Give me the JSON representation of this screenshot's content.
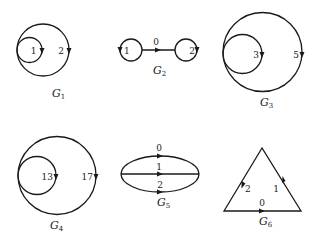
{
  "diagram": {
    "title": "",
    "colors": {
      "ink": "#1a1a1a",
      "background": "#ffffff"
    },
    "graphs": [
      {
        "id": "G1",
        "name": "G",
        "subscript": "1",
        "shape": "two internally tangent loops",
        "edges": [
          {
            "label": "1",
            "type": "inner-loop",
            "arrow": "down"
          },
          {
            "label": "2",
            "type": "outer-loop",
            "arrow": "down"
          }
        ]
      },
      {
        "id": "G2",
        "name": "G",
        "subscript": "2",
        "shape": "two loops joined by an edge",
        "edges": [
          {
            "label": "1",
            "type": "left-loop",
            "arrow": "down"
          },
          {
            "label": "0",
            "type": "connecting-edge",
            "arrow": "right"
          },
          {
            "label": "2",
            "type": "right-loop",
            "arrow": "down"
          }
        ]
      },
      {
        "id": "G3",
        "name": "G",
        "subscript": "3",
        "shape": "two internally tangent loops",
        "edges": [
          {
            "label": "3",
            "type": "inner-loop",
            "arrow": "down"
          },
          {
            "label": "5",
            "type": "outer-loop",
            "arrow": "down"
          }
        ]
      },
      {
        "id": "G4",
        "name": "G",
        "subscript": "4",
        "shape": "two internally tangent loops",
        "edges": [
          {
            "label": "13",
            "type": "inner-loop",
            "arrow": "down"
          },
          {
            "label": "17",
            "type": "outer-loop",
            "arrow": "down"
          }
        ]
      },
      {
        "id": "G5",
        "name": "G",
        "subscript": "5",
        "shape": "theta graph (three parallel edges)",
        "edges": [
          {
            "label": "0",
            "type": "top-arc",
            "arrow": "right"
          },
          {
            "label": "1",
            "type": "middle-edge",
            "arrow": "right"
          },
          {
            "label": "2",
            "type": "bottom-arc",
            "arrow": "right"
          }
        ]
      },
      {
        "id": "G6",
        "name": "G",
        "subscript": "6",
        "shape": "directed triangle",
        "edges": [
          {
            "label": "2",
            "type": "left-side",
            "arrow": "down"
          },
          {
            "label": "1",
            "type": "right-side",
            "arrow": "up"
          },
          {
            "label": "0",
            "type": "base",
            "arrow": "right"
          }
        ]
      }
    ]
  }
}
